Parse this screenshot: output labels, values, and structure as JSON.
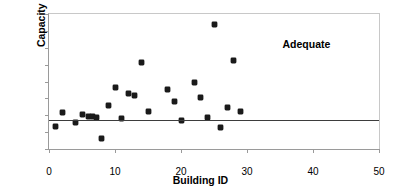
{
  "chart_data": {
    "type": "scatter",
    "title": "",
    "xlabel": "Building ID",
    "ylabel": "Capacity Index",
    "xlim": [
      0,
      50
    ],
    "ylim": [
      0,
      8
    ],
    "xticks": [
      0,
      10,
      20,
      30,
      40,
      50
    ],
    "yticks": [
      0,
      1,
      2,
      3,
      4,
      5,
      6,
      7,
      8
    ],
    "grid": false,
    "legend": "none",
    "series": [
      {
        "name": "Capacity Index",
        "marker": "diamond",
        "color": "#1a1a1a",
        "points": [
          {
            "x": 1,
            "y": 1.35
          },
          {
            "x": 2,
            "y": 2.15
          },
          {
            "x": 4,
            "y": 1.55
          },
          {
            "x": 5,
            "y": 2.05
          },
          {
            "x": 6,
            "y": 1.9
          },
          {
            "x": 6.6,
            "y": 1.9
          },
          {
            "x": 7.2,
            "y": 1.85
          },
          {
            "x": 8,
            "y": 0.65
          },
          {
            "x": 9,
            "y": 2.55
          },
          {
            "x": 10,
            "y": 3.65
          },
          {
            "x": 11,
            "y": 1.8
          },
          {
            "x": 12,
            "y": 3.3
          },
          {
            "x": 13,
            "y": 3.15
          },
          {
            "x": 14,
            "y": 5.1
          },
          {
            "x": 15,
            "y": 2.25
          },
          {
            "x": 18,
            "y": 3.5
          },
          {
            "x": 19,
            "y": 2.8
          },
          {
            "x": 20,
            "y": 1.7
          },
          {
            "x": 22,
            "y": 3.95
          },
          {
            "x": 23,
            "y": 3.05
          },
          {
            "x": 24,
            "y": 1.85
          },
          {
            "x": 25,
            "y": 7.35
          },
          {
            "x": 26,
            "y": 1.3
          },
          {
            "x": 27,
            "y": 2.45
          },
          {
            "x": 28,
            "y": 5.25
          },
          {
            "x": 29,
            "y": 2.25
          }
        ]
      }
    ],
    "threshold_line": {
      "value": 1.7,
      "orientation": "horizontal",
      "color": "#3d3d3d",
      "x_start": 0,
      "x_end": 50
    },
    "annotations": [
      {
        "text": "Adequate",
        "x": 39,
        "y": 6.2,
        "bold": true,
        "color": "#000000"
      }
    ]
  },
  "axes": {
    "x_title": "Building ID",
    "y_title": "Capacity Index",
    "x_tick_labels": [
      "0",
      "10",
      "20",
      "30",
      "40",
      "50"
    ],
    "y_tick_labels": [
      "0",
      "1",
      "2",
      "3",
      "4",
      "5",
      "6",
      "7",
      "8"
    ]
  },
  "colors": {
    "marker": "#1a1a1a",
    "threshold": "#3d3d3d",
    "axis": "#9a9a9a",
    "frame": "#c8c8c8",
    "background": "#ffffff",
    "text": "#000000"
  }
}
